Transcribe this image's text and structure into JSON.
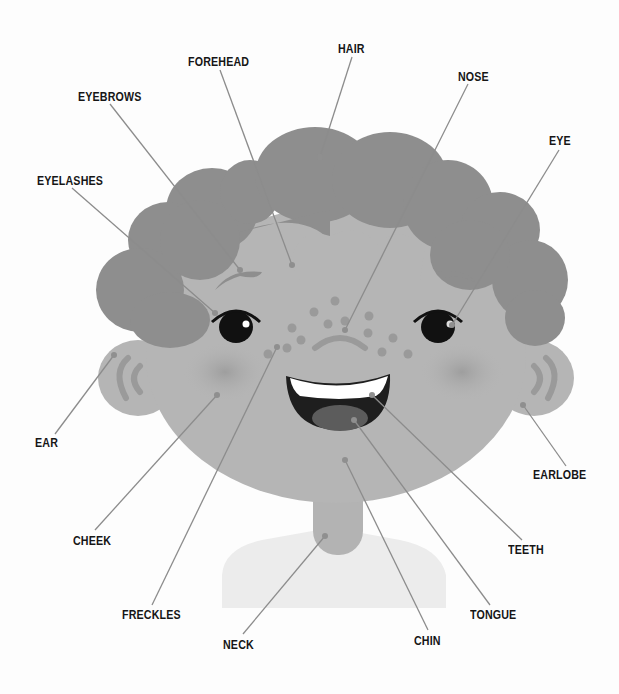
{
  "diagram": {
    "colors": {
      "background": "#fdfdfd",
      "hair": "#8e8e8e",
      "skin": "#b5b5b5",
      "cheek_blush": "#9d9d9d",
      "freckle": "#999999",
      "eye": "#111111",
      "mouth": "#1e1e1e",
      "tongue": "#5c5c5c",
      "teeth": "#ffffff",
      "shirt": "#ececec",
      "leader_line": "#8c8c8c",
      "label_text": "#161616"
    },
    "labels": [
      {
        "id": "forehead",
        "text": "FOREHEAD",
        "x": 188,
        "y": 55,
        "anchor": [
          292,
          265
        ],
        "line_from": [
          220,
          70
        ]
      },
      {
        "id": "hair",
        "text": "HAIR",
        "x": 338,
        "y": 42,
        "anchor": [
          320,
          157
        ],
        "line_from": [
          352,
          57
        ]
      },
      {
        "id": "nose",
        "text": "NOSE",
        "x": 458,
        "y": 70,
        "anchor": [
          345,
          330
        ],
        "line_from": [
          468,
          84
        ]
      },
      {
        "id": "eyebrows",
        "text": "EYEBROWS",
        "x": 78,
        "y": 90,
        "anchor": [
          240,
          270
        ],
        "line_from": [
          110,
          104
        ]
      },
      {
        "id": "eye",
        "text": "EYE",
        "x": 549,
        "y": 134,
        "anchor": [
          452,
          325
        ],
        "line_from": [
          559,
          150
        ]
      },
      {
        "id": "eyelashes",
        "text": "EYELASHES",
        "x": 37,
        "y": 174,
        "anchor": [
          215,
          313
        ],
        "line_from": [
          72,
          188
        ]
      },
      {
        "id": "ear",
        "text": "EAR",
        "x": 35,
        "y": 436,
        "anchor": [
          114,
          355
        ],
        "line_from": [
          55,
          434
        ]
      },
      {
        "id": "earlobe",
        "text": "EARLOBE",
        "x": 533,
        "y": 468,
        "anchor": [
          523,
          405
        ],
        "line_from": [
          566,
          466
        ]
      },
      {
        "id": "cheek",
        "text": "CHEEK",
        "x": 73,
        "y": 534,
        "anchor": [
          217,
          395
        ],
        "line_from": [
          95,
          530
        ]
      },
      {
        "id": "teeth",
        "text": "TEETH",
        "x": 508,
        "y": 543,
        "anchor": [
          372,
          395
        ],
        "line_from": [
          522,
          540
        ]
      },
      {
        "id": "freckles",
        "text": "FRECKLES",
        "x": 122,
        "y": 608,
        "anchor": [
          277,
          347
        ],
        "line_from": [
          152,
          605
        ]
      },
      {
        "id": "tongue",
        "text": "TONGUE",
        "x": 470,
        "y": 608,
        "anchor": [
          354,
          420
        ],
        "line_from": [
          490,
          605
        ]
      },
      {
        "id": "chin",
        "text": "CHIN",
        "x": 414,
        "y": 634,
        "anchor": [
          345,
          460
        ],
        "line_from": [
          428,
          630
        ]
      },
      {
        "id": "neck",
        "text": "NECK",
        "x": 223,
        "y": 638,
        "anchor": [
          325,
          536
        ],
        "line_from": [
          243,
          634
        ]
      }
    ]
  }
}
